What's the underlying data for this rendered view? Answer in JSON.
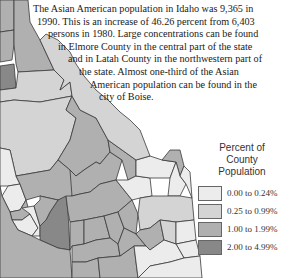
{
  "description": {
    "lines": [
      "The Asian American population in Idaho was 9,365 in",
      "1990. This is an increase of 46.26 percent from 6,403",
      "persons in 1980. Large concentrations can be found",
      "in Elmore County in the central part of the state",
      "and in Latah County in the northwestern part of",
      "the state. Almost one-third of the Asian",
      "American population can be found in the",
      "city of Boise."
    ],
    "indents": [
      33,
      37,
      48,
      58,
      68,
      79,
      90,
      99
    ]
  },
  "legend": {
    "title_lines": [
      "Percent of",
      "County",
      "Population"
    ],
    "items": [
      {
        "label": "0.00 to 0.24%",
        "color": "#ececec"
      },
      {
        "label": "0.25 to 0.99%",
        "color": "#d4d4d4"
      },
      {
        "label": "1.00 to 1.99%",
        "color": "#b0b0b0"
      },
      {
        "label": "2.00 to 4.99%",
        "color": "#888888"
      }
    ]
  },
  "map": {
    "state": "Idaho",
    "highlighted_counties": [
      "Elmore County",
      "Latah County"
    ],
    "highlighted_city": "Boise"
  }
}
